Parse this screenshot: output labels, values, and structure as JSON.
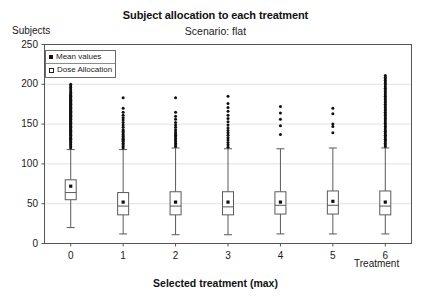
{
  "chart_data": {
    "type": "box",
    "title": "Subject allocation to each treatment",
    "subtitle": "Scenario: flat",
    "xlabel": "Selected treatment (max)",
    "xaxis_title": "Treatment",
    "ylabel": "Subjects",
    "ylim": [
      0,
      250
    ],
    "yticks": [
      0,
      50,
      100,
      150,
      200,
      250
    ],
    "xticks": [
      "0",
      "1",
      "2",
      "3",
      "4",
      "5",
      "6"
    ],
    "grid": true,
    "grid_orientation": "horizontal",
    "legend": {
      "position": "top-left-inside",
      "entries": [
        {
          "label": "Mean values",
          "marker": "filled-square"
        },
        {
          "label": "Dose Allocation",
          "marker": "open-square"
        }
      ]
    },
    "categories": [
      "0",
      "1",
      "2",
      "3",
      "4",
      "5",
      "6"
    ],
    "series": [
      {
        "name": "Dose Allocation",
        "boxes": [
          {
            "category": "0",
            "whisker_low": 20,
            "q1": 55,
            "median": 64,
            "mean": 72,
            "q3": 80,
            "whisker_high": 118,
            "outliers": [
              120,
              122,
              124,
              125,
              127,
              128,
              130,
              131,
              132,
              133,
              134,
              136,
              137,
              138,
              139,
              140,
              141,
              142,
              143,
              144,
              145,
              146,
              147,
              148,
              149,
              150,
              151,
              152,
              153,
              154,
              155,
              156,
              157,
              158,
              159,
              160,
              161,
              162,
              163,
              164,
              165,
              166,
              167,
              168,
              169,
              170,
              171,
              172,
              173,
              174,
              175,
              176,
              177,
              178,
              179,
              180,
              181,
              182,
              183,
              184,
              185,
              186,
              187,
              188,
              190,
              192,
              194,
              196,
              198,
              200
            ]
          },
          {
            "category": "1",
            "whisker_low": 12,
            "q1": 36,
            "median": 47,
            "mean": 52,
            "q3": 64,
            "whisker_high": 118,
            "outliers": [
              120,
              122,
              124,
              126,
              128,
              129,
              131,
              132,
              134,
              135,
              137,
              139,
              141,
              143,
              146,
              149,
              152,
              155,
              158,
              161,
              165,
              170,
              183
            ]
          },
          {
            "category": "2",
            "whisker_low": 11,
            "q1": 36,
            "median": 47,
            "mean": 52,
            "q3": 65,
            "whisker_high": 120,
            "outliers": [
              122,
              124,
              126,
              128,
              130,
              132,
              134,
              136,
              138,
              140,
              143,
              146,
              149,
              152,
              156,
              160,
              165,
              183
            ]
          },
          {
            "category": "3",
            "whisker_low": 11,
            "q1": 36,
            "median": 46,
            "mean": 52,
            "q3": 65,
            "whisker_high": 119,
            "outliers": [
              121,
              124,
              127,
              130,
              133,
              136,
              139,
              142,
              145,
              149,
              153,
              157,
              161,
              166,
              171,
              176,
              185
            ]
          },
          {
            "category": "4",
            "whisker_low": 12,
            "q1": 37,
            "median": 48,
            "mean": 52,
            "q3": 65,
            "whisker_high": 119,
            "outliers": [
              137,
              148,
              156,
              164,
              172
            ]
          },
          {
            "category": "5",
            "whisker_low": 12,
            "q1": 37,
            "median": 48,
            "mean": 53,
            "q3": 66,
            "whisker_high": 120,
            "outliers": [
              139,
              147,
              150,
              163,
              170
            ]
          },
          {
            "category": "6",
            "whisker_low": 12,
            "q1": 36,
            "median": 47,
            "mean": 52,
            "q3": 66,
            "whisker_high": 120,
            "outliers": [
              122,
              124,
              126,
              128,
              130,
              131,
              133,
              135,
              136,
              138,
              140,
              141,
              143,
              145,
              147,
              149,
              151,
              153,
              155,
              157,
              159,
              161,
              163,
              165,
              167,
              169,
              171,
              173,
              175,
              177,
              179,
              181,
              183,
              185,
              187,
              189,
              191,
              193,
              195,
              197,
              199,
              201,
              203,
              205,
              207,
              209,
              211
            ]
          }
        ]
      }
    ]
  },
  "colors": {
    "axis": "#555555",
    "grid": "#e2e2e2",
    "box_stroke": "#5a5a5a",
    "outlier": "#101010",
    "mean_marker": "#101010",
    "background": "#ffffff"
  }
}
